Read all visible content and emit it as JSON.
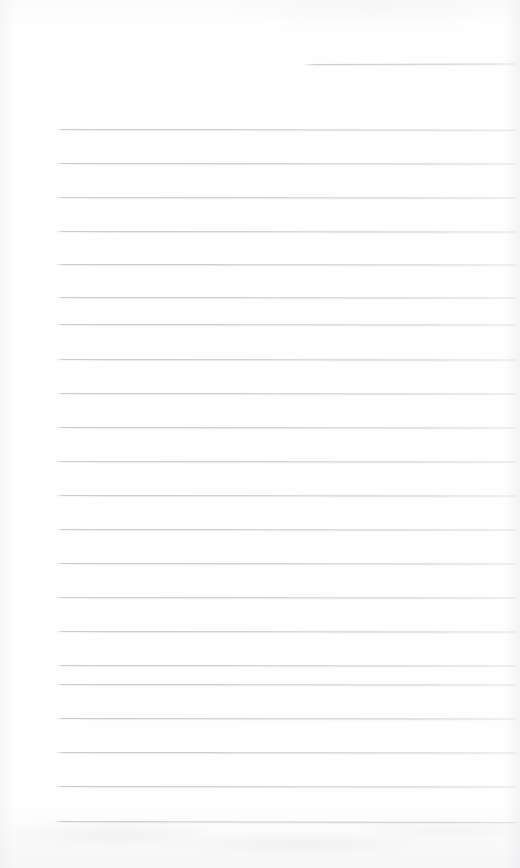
{
  "page": {
    "kind": "ruled-notepad-page",
    "width": 520,
    "height": 868,
    "background_color": "#fefefe",
    "rule_color": "#c7c7ce",
    "content_text": "",
    "note": "blank ruled page, no written content"
  },
  "rules": [
    {
      "name": "rule-top-partial",
      "x": 305,
      "y": 64,
      "width": 211,
      "slope": -0.6,
      "short": true
    },
    {
      "name": "rule-1",
      "x": 57,
      "y": 129,
      "width": 459,
      "slope": 0.8,
      "short": false
    },
    {
      "name": "rule-2",
      "x": 57,
      "y": 163,
      "width": 459,
      "slope": 0.6,
      "short": false
    },
    {
      "name": "rule-3",
      "x": 57,
      "y": 197,
      "width": 459,
      "slope": 0.5,
      "short": false
    },
    {
      "name": "rule-4",
      "x": 57,
      "y": 231,
      "width": 459,
      "slope": 0.5,
      "short": false
    },
    {
      "name": "rule-5",
      "x": 57,
      "y": 264,
      "width": 459,
      "slope": 0.6,
      "short": false
    },
    {
      "name": "rule-6",
      "x": 57,
      "y": 297,
      "width": 459,
      "slope": 0.5,
      "short": false
    },
    {
      "name": "rule-7",
      "x": 57,
      "y": 324,
      "width": 459,
      "slope": 0.6,
      "short": false
    },
    {
      "name": "rule-8",
      "x": 57,
      "y": 359,
      "width": 459,
      "slope": 0.5,
      "short": false
    },
    {
      "name": "rule-9",
      "x": 57,
      "y": 393,
      "width": 459,
      "slope": 0.6,
      "short": false
    },
    {
      "name": "rule-10",
      "x": 57,
      "y": 427,
      "width": 459,
      "slope": 0.5,
      "short": false
    },
    {
      "name": "rule-11",
      "x": 57,
      "y": 461,
      "width": 459,
      "slope": 0.6,
      "short": false
    },
    {
      "name": "rule-12",
      "x": 57,
      "y": 495,
      "width": 459,
      "slope": 0.5,
      "short": false
    },
    {
      "name": "rule-13",
      "x": 57,
      "y": 529,
      "width": 459,
      "slope": 0.6,
      "short": false
    },
    {
      "name": "rule-14",
      "x": 57,
      "y": 563,
      "width": 459,
      "slope": 0.5,
      "short": false
    },
    {
      "name": "rule-15",
      "x": 57,
      "y": 597,
      "width": 459,
      "slope": 0.6,
      "short": false
    },
    {
      "name": "rule-16",
      "x": 57,
      "y": 631,
      "width": 459,
      "slope": 0.5,
      "short": false
    },
    {
      "name": "rule-17",
      "x": 57,
      "y": 665,
      "width": 459,
      "slope": 0.6,
      "short": false
    },
    {
      "name": "rule-18",
      "x": 57,
      "y": 684,
      "width": 459,
      "slope": 0.5,
      "short": false
    },
    {
      "name": "rule-19",
      "x": 57,
      "y": 718,
      "width": 459,
      "slope": 0.6,
      "short": false
    },
    {
      "name": "rule-20",
      "x": 57,
      "y": 752,
      "width": 459,
      "slope": 0.5,
      "short": false
    },
    {
      "name": "rule-21",
      "x": 57,
      "y": 786,
      "width": 459,
      "slope": 0.6,
      "short": false
    },
    {
      "name": "rule-22",
      "x": 57,
      "y": 821,
      "width": 459,
      "slope": 0.9,
      "short": false
    }
  ]
}
